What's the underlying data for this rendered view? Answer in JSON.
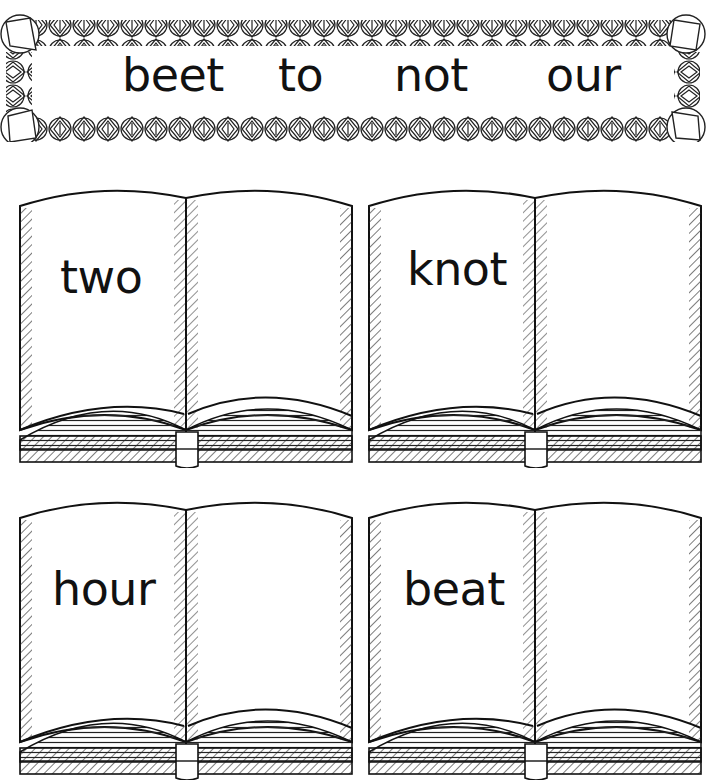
{
  "word_bank": {
    "words": [
      "beet",
      "to",
      "not",
      "our"
    ]
  },
  "books": [
    {
      "word": "two"
    },
    {
      "word": "knot"
    },
    {
      "word": "hour"
    },
    {
      "word": "beat"
    }
  ],
  "colors": {
    "ink": "#111111",
    "paper": "#ffffff"
  }
}
